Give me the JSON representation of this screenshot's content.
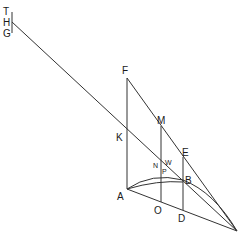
{
  "diagram": {
    "labels": {
      "T": "T",
      "H": "H",
      "G": "G",
      "F": "F",
      "M": "M",
      "K": "K",
      "E": "E",
      "N": "N",
      "W": "W",
      "P": "P",
      "B": "B",
      "A": "A",
      "O": "O",
      "D": "D"
    },
    "colors": {
      "line": "#333333",
      "text": "#1a1a1a",
      "background": "#ffffff"
    }
  }
}
